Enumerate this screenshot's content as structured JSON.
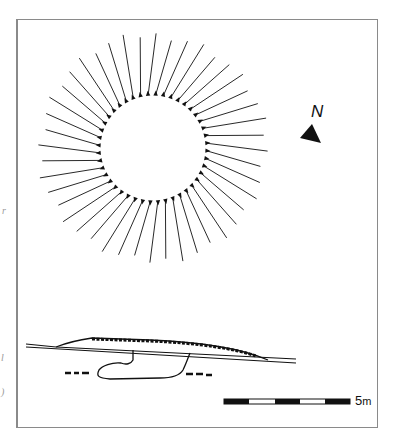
{
  "figure": {
    "type": "archaeological site plan and section",
    "plan": {
      "feature": "circular mound with radial hachures",
      "hachure_count": 44,
      "center": [
        153,
        148
      ],
      "inner_radius": 53,
      "outer_radius": 113
    },
    "section": {
      "feature": "mound profile with buried pit"
    },
    "north_arrow": {
      "label": "N"
    },
    "scale_bar": {
      "label_value": "5",
      "label_unit": "m",
      "segments": [
        "black",
        "white",
        "black",
        "white",
        "black"
      ]
    },
    "margin_marks": [
      "r",
      "l",
      ")"
    ],
    "colors": {
      "ink": "#111111",
      "frame": "#8a8a8a",
      "background": "#ffffff"
    }
  }
}
